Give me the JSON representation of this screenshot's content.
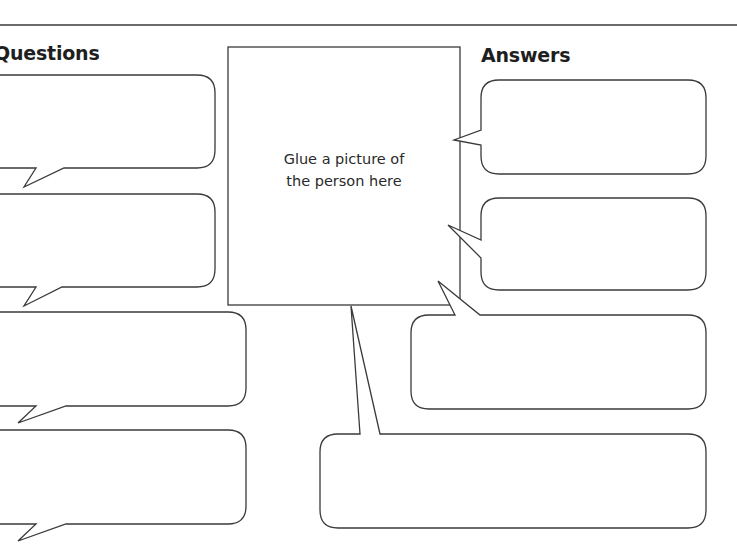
{
  "headings": {
    "questions": "Questions",
    "answers": "Answers"
  },
  "picture_box": {
    "line1": "Glue a picture of",
    "line2": "the person here"
  },
  "colors": {
    "stroke": "#3a3a3a",
    "background": "#ffffff",
    "text": "#1e1e1e"
  },
  "question_bubbles": [
    {
      "id": 1,
      "text": ""
    },
    {
      "id": 2,
      "text": ""
    },
    {
      "id": 3,
      "text": ""
    },
    {
      "id": 4,
      "text": ""
    }
  ],
  "answer_bubbles": [
    {
      "id": 1,
      "text": ""
    },
    {
      "id": 2,
      "text": ""
    },
    {
      "id": 3,
      "text": ""
    },
    {
      "id": 4,
      "text": ""
    }
  ]
}
